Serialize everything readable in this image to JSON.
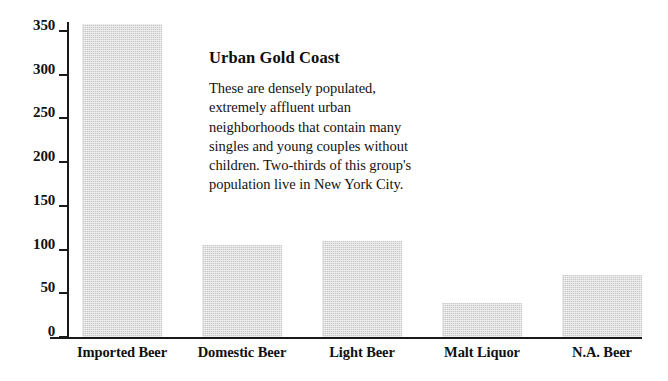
{
  "chart_data": {
    "type": "bar",
    "title": "",
    "xlabel": "",
    "ylabel": "",
    "categories": [
      "Imported Beer",
      "Domestic Beer",
      "Light Beer",
      "Malt Liquor",
      "N.A. Beer"
    ],
    "values": [
      358,
      105,
      110,
      39,
      71
    ],
    "ylim": [
      0,
      360
    ],
    "yticks": [
      0,
      50,
      100,
      150,
      200,
      250,
      300,
      350
    ],
    "ytick_labels": [
      "0",
      "50",
      "100",
      "150",
      "200",
      "250",
      "300",
      "350"
    ],
    "grid": false,
    "legend": "none",
    "bar_color": "#c9c9c9",
    "axis_color": "#1a1a1a",
    "background_color": "#ffffff"
  },
  "annotation": {
    "title": "Urban Gold Coast",
    "body": "These are densely populated,\nextremely affluent urban\nneighborhoods that contain many\nsingles and young couples without\nchildren.  Two-thirds of this group's\npopulation live in New York City."
  }
}
